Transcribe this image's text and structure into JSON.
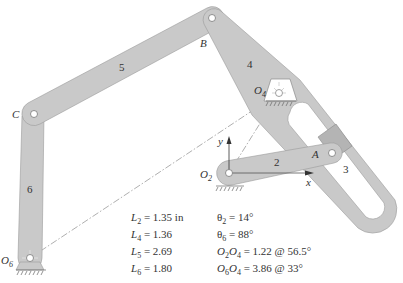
{
  "diagram": {
    "title": "",
    "colors": {
      "link_fill": "#c9c9c9",
      "link_stroke": "#9a9a9a",
      "block_fill": "#b4b4b4",
      "text": "#333333",
      "centerline": "#9a9a9a"
    },
    "joints": {
      "B": "B",
      "C": "C",
      "A": "A",
      "O2": {
        "main": "O",
        "sub": "2"
      },
      "O4": {
        "main": "O",
        "sub": "4"
      },
      "O6": {
        "main": "O",
        "sub": "6"
      }
    },
    "link_numbers": {
      "link2": "2",
      "link3": "3",
      "link4": "4",
      "link5": "5",
      "link6": "6"
    },
    "axes": {
      "x": "x",
      "y": "y"
    },
    "given_lengths": [
      {
        "sym": "L",
        "sub": "2",
        "value": " = 1.35 in"
      },
      {
        "sym": "L",
        "sub": "4",
        "value": " = 1.36"
      },
      {
        "sym": "L",
        "sub": "5",
        "value": " = 2.69"
      },
      {
        "sym": "L",
        "sub": "6",
        "value": " = 1.80"
      }
    ],
    "given_angles": [
      {
        "sym": "θ",
        "sub": "2",
        "value": " = 14°"
      },
      {
        "sym": "θ",
        "sub": "6",
        "value": " = 88°"
      }
    ],
    "given_vectors": [
      {
        "a": "O",
        "asub": "2",
        "b": "O",
        "bsub": "4",
        "value": " = 1.22 @ 56.5°"
      },
      {
        "a": "O",
        "asub": "6",
        "b": "O",
        "bsub": "4",
        "value": " = 3.86 @ 33°"
      }
    ]
  }
}
